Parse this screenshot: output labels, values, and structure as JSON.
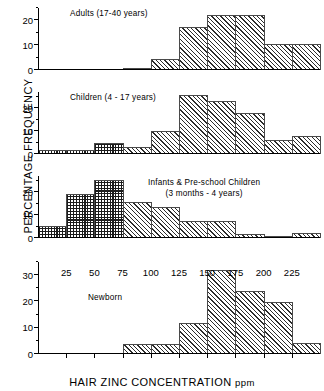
{
  "chart_data": {
    "type": "bar",
    "title": "",
    "xlabel": "HAIR ZINC CONCENTRATION ppm",
    "xlabel_main": "HAIR ZINC CONCENTRATION",
    "xlabel_unit": "ppm",
    "ylabel": "PERCENTAGE FREQUENCY",
    "xlim": [
      0,
      250
    ],
    "xticks": [
      25,
      50,
      75,
      100,
      125,
      150,
      175,
      200,
      225
    ],
    "bin_width": 25,
    "bin_edges": [
      0,
      25,
      50,
      75,
      100,
      125,
      150,
      175,
      200,
      225,
      250
    ],
    "grid": false,
    "legend": "none",
    "fill_patterns": {
      "diagonal_hatch": "diagonal-hatch",
      "cross_hatch": "cross-hatch"
    },
    "panels": [
      {
        "id": "adults",
        "title": "Adults (17-40 years)",
        "ylim": [
          0,
          25
        ],
        "yticks": [
          0,
          10,
          20
        ],
        "yticks_minor": [
          5,
          15,
          25
        ],
        "bins": [
          {
            "x0": 0,
            "x1": 25,
            "value": 0,
            "pattern": "diagonal_hatch"
          },
          {
            "x0": 25,
            "x1": 50,
            "value": 0,
            "pattern": "diagonal_hatch"
          },
          {
            "x0": 50,
            "x1": 75,
            "value": 0,
            "pattern": "diagonal_hatch"
          },
          {
            "x0": 75,
            "x1": 100,
            "value": 0.7,
            "pattern": "diagonal_hatch"
          },
          {
            "x0": 100,
            "x1": 125,
            "value": 4.5,
            "pattern": "diagonal_hatch"
          },
          {
            "x0": 125,
            "x1": 150,
            "value": 17.3,
            "pattern": "diagonal_hatch"
          },
          {
            "x0": 150,
            "x1": 175,
            "value": 22.0,
            "pattern": "diagonal_hatch"
          },
          {
            "x0": 175,
            "x1": 200,
            "value": 22.0,
            "pattern": "diagonal_hatch"
          },
          {
            "x0": 200,
            "x1": 225,
            "value": 10.5,
            "pattern": "diagonal_hatch"
          },
          {
            "x0": 225,
            "x1": 250,
            "value": 10.5,
            "pattern": "diagonal_hatch"
          }
        ]
      },
      {
        "id": "children",
        "title": "Children (4 - 17 years)",
        "ylim": [
          0,
          27
        ],
        "yticks": [
          0,
          10,
          20
        ],
        "yticks_minor": [
          5,
          15,
          25
        ],
        "bins": [
          {
            "x0": 0,
            "x1": 25,
            "value": 1.7,
            "pattern": "cross_hatch"
          },
          {
            "x0": 25,
            "x1": 50,
            "value": 1.7,
            "pattern": "cross_hatch"
          },
          {
            "x0": 50,
            "x1": 75,
            "value": 5.0,
            "pattern": "cross_hatch"
          },
          {
            "x0": 75,
            "x1": 100,
            "value": 3.2,
            "pattern": "diagonal_hatch"
          },
          {
            "x0": 100,
            "x1": 125,
            "value": 10.0,
            "pattern": "diagonal_hatch"
          },
          {
            "x0": 125,
            "x1": 150,
            "value": 25.5,
            "pattern": "diagonal_hatch"
          },
          {
            "x0": 150,
            "x1": 175,
            "value": 23.3,
            "pattern": "diagonal_hatch"
          },
          {
            "x0": 175,
            "x1": 200,
            "value": 18.0,
            "pattern": "diagonal_hatch"
          },
          {
            "x0": 200,
            "x1": 225,
            "value": 6.3,
            "pattern": "diagonal_hatch"
          },
          {
            "x0": 225,
            "x1": 250,
            "value": 7.8,
            "pattern": "diagonal_hatch"
          }
        ]
      },
      {
        "id": "infants-preschool",
        "title": "Infants & Pre-school Children",
        "subtitle": "(3 months - 4 years)",
        "ylim": [
          0,
          27
        ],
        "yticks": [
          0,
          10,
          20
        ],
        "yticks_minor": [
          5,
          15,
          25
        ],
        "bins": [
          {
            "x0": 0,
            "x1": 25,
            "value": 5.2,
            "pattern": "cross_hatch"
          },
          {
            "x0": 25,
            "x1": 50,
            "value": 19.0,
            "pattern": "cross_hatch"
          },
          {
            "x0": 50,
            "x1": 75,
            "value": 25.3,
            "pattern": "cross_hatch"
          },
          {
            "x0": 75,
            "x1": 100,
            "value": 15.5,
            "pattern": "diagonal_hatch"
          },
          {
            "x0": 100,
            "x1": 125,
            "value": 13.3,
            "pattern": "diagonal_hatch"
          },
          {
            "x0": 125,
            "x1": 150,
            "value": 7.6,
            "pattern": "diagonal_hatch"
          },
          {
            "x0": 150,
            "x1": 175,
            "value": 7.6,
            "pattern": "diagonal_hatch"
          },
          {
            "x0": 175,
            "x1": 200,
            "value": 1.6,
            "pattern": "diagonal_hatch"
          },
          {
            "x0": 200,
            "x1": 225,
            "value": 1.0,
            "pattern": "diagonal_hatch"
          },
          {
            "x0": 225,
            "x1": 250,
            "value": 2.0,
            "pattern": "diagonal_hatch"
          }
        ]
      },
      {
        "id": "newborn",
        "title": "Newborn",
        "ylim": [
          0,
          35
        ],
        "yticks": [
          0,
          10,
          20,
          30
        ],
        "yticks_minor": [
          5,
          15,
          25,
          35
        ],
        "bins": [
          {
            "x0": 0,
            "x1": 25,
            "value": 0,
            "pattern": "diagonal_hatch"
          },
          {
            "x0": 25,
            "x1": 50,
            "value": 0,
            "pattern": "diagonal_hatch"
          },
          {
            "x0": 50,
            "x1": 75,
            "value": 0,
            "pattern": "diagonal_hatch"
          },
          {
            "x0": 75,
            "x1": 100,
            "value": 4.0,
            "pattern": "diagonal_hatch"
          },
          {
            "x0": 100,
            "x1": 125,
            "value": 4.0,
            "pattern": "diagonal_hatch"
          },
          {
            "x0": 125,
            "x1": 150,
            "value": 11.8,
            "pattern": "diagonal_hatch"
          },
          {
            "x0": 150,
            "x1": 175,
            "value": 31.8,
            "pattern": "diagonal_hatch"
          },
          {
            "x0": 175,
            "x1": 200,
            "value": 23.8,
            "pattern": "diagonal_hatch"
          },
          {
            "x0": 200,
            "x1": 225,
            "value": 19.8,
            "pattern": "diagonal_hatch"
          },
          {
            "x0": 225,
            "x1": 250,
            "value": 4.2,
            "pattern": "diagonal_hatch"
          }
        ]
      }
    ]
  }
}
